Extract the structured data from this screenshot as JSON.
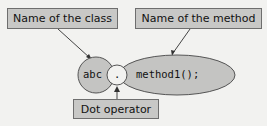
{
  "labels": {
    "class_label": "Name of the class",
    "method_label": "Name of the method",
    "dot_label": "Dot operator"
  },
  "code": {
    "class_name": "abc",
    "dot": ".",
    "method_call": "method1();"
  },
  "colors": {
    "background": "#f2f2f0",
    "box_fill": "#c8c8c6",
    "shape_fill": "#c4c4c2",
    "stroke": "#555555"
  }
}
